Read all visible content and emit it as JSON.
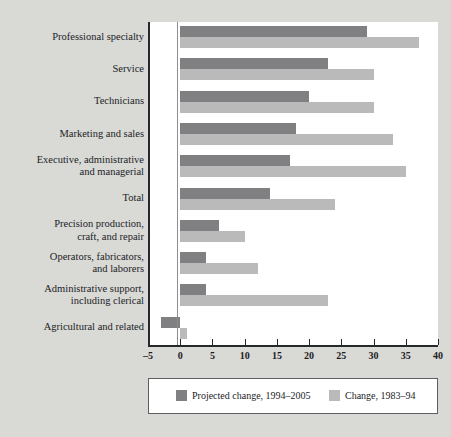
{
  "chart_data": {
    "type": "bar",
    "orientation": "horizontal",
    "title": "",
    "xlabel": "",
    "ylabel": "",
    "xlim": [
      -5,
      40
    ],
    "xticks": [
      -5,
      0,
      5,
      10,
      15,
      20,
      25,
      30,
      35,
      40
    ],
    "xtick_labels": [
      "-5",
      "0",
      "5",
      "10",
      "15",
      "20",
      "25",
      "30",
      "35",
      "40"
    ],
    "grid": false,
    "legend_position": "bottom",
    "categories": [
      "Professional specialty",
      "Service",
      "Technicians",
      "Marketing and sales",
      "Executive, administrative\nand managerial",
      "Total",
      "Precision production,\ncraft, and repair",
      "Operators, fabricators,\nand laborers",
      "Administrative support,\nincluding clerical",
      "Agricultural and related"
    ],
    "series": [
      {
        "name": "Projected change, 1994–2005",
        "color": "#808083",
        "values": [
          29,
          23,
          20,
          18,
          17,
          14,
          6,
          4,
          4,
          -3
        ]
      },
      {
        "name": "Change, 1983–94",
        "color": "#b9bab9",
        "values": [
          37,
          30,
          30,
          33,
          35,
          24,
          10,
          12,
          23,
          1
        ]
      }
    ]
  },
  "legend": {
    "entries": [
      {
        "label": "Projected change, 1994–2005",
        "swatch": "dark"
      },
      {
        "label": "Change, 1983–94",
        "swatch": "light"
      }
    ]
  },
  "colors": {
    "dark_bar": "#808083",
    "light_bar": "#b9bab9",
    "axis": "#26292b",
    "panel_background": "#ffffff",
    "figure_background": "#d9d9d6"
  }
}
